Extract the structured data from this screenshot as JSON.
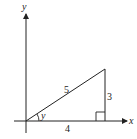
{
  "diagram": {
    "axes": {
      "x_label": "x",
      "y_label": "y"
    },
    "triangle": {
      "hypotenuse_label": "5",
      "vertical_leg_label": "3",
      "horizontal_leg_label": "4",
      "angle_label": "y",
      "right_angle_marker": true
    },
    "colors": {
      "stroke": "#222222",
      "background": "#ffffff"
    }
  }
}
